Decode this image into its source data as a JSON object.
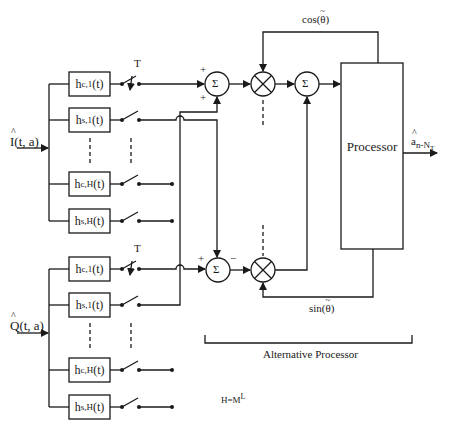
{
  "diagram": {
    "type": "block-diagram",
    "inputs": {
      "in_phase": {
        "base": "I",
        "args": "(t, a)"
      },
      "quadrature": {
        "base": "Q",
        "args": "(t, a)"
      }
    },
    "filter_bank_I": [
      {
        "base": "h",
        "sub": "c,1",
        "arg": "(t)"
      },
      {
        "base": "h",
        "sub": "s,1",
        "arg": "(t)"
      },
      {
        "base": "h",
        "sub": "c,H",
        "arg": "(t)"
      },
      {
        "base": "h",
        "sub": "s,H",
        "arg": "(t)"
      }
    ],
    "filter_bank_Q": [
      {
        "base": "h",
        "sub": "c,1",
        "arg": "(t)"
      },
      {
        "base": "h",
        "sub": "s,1",
        "arg": "(t)"
      },
      {
        "base": "h",
        "sub": "c,H",
        "arg": "(t)"
      },
      {
        "base": "h",
        "sub": "s,H",
        "arg": "(t)"
      }
    ],
    "sampler_label_top": "T",
    "sampler_label_bottom": "T",
    "sum_symbol": "Σ",
    "upper_sum_signs": {
      "top": "+",
      "bottom": "+"
    },
    "lower_sum_signs": {
      "left": "+",
      "right": "−"
    },
    "cos_label": {
      "fn": "cos(",
      "var": "θ",
      "close": ")"
    },
    "sin_label": {
      "fn": "sin(",
      "var": "θ",
      "close": ")"
    },
    "processor_label": "Processor",
    "output_label": {
      "base": "a",
      "sub": "n-N",
      "subsub": "T"
    },
    "bracket_label": "Alternative Processor",
    "note": {
      "base": "H=M",
      "sup": "L"
    }
  }
}
